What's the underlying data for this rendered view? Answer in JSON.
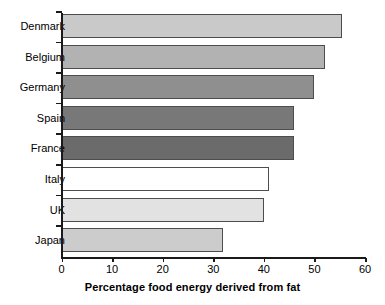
{
  "chart_data": {
    "type": "bar",
    "orientation": "horizontal",
    "title": "",
    "xlabel": "Percentage food energy derived from fat",
    "ylabel": "",
    "xlim": [
      0,
      60
    ],
    "xticks": [
      0,
      10,
      20,
      30,
      40,
      50,
      60
    ],
    "xtick_labels": [
      "0",
      "10",
      "20",
      "30",
      "40",
      "50",
      "60"
    ],
    "grid": false,
    "legend": false,
    "categories": [
      "Denmark",
      "Belgium",
      "Germany",
      "Spain",
      "France",
      "Italy",
      "UK",
      "Japan"
    ],
    "values": [
      55.5,
      52,
      50,
      46,
      46,
      41,
      40,
      32
    ],
    "bar_colors": [
      "#c9c9c9",
      "#b2b2b2",
      "#8f8f8f",
      "#787878",
      "#6b6b6b",
      "#ffffff",
      "#e2e2e2",
      "#cccccc"
    ],
    "bar_edge_color": "#4d4d4d",
    "axis_color": "#1a1a1a",
    "background": "#ffffff"
  },
  "bars": [
    {
      "label": "Denmark",
      "value": 55.5,
      "color": "#c9c9c9"
    },
    {
      "label": "Belgium",
      "value": 52,
      "color": "#b2b2b2"
    },
    {
      "label": "Germany",
      "value": 50,
      "color": "#8f8f8f"
    },
    {
      "label": "Spain",
      "value": 46,
      "color": "#787878"
    },
    {
      "label": "France",
      "value": 46,
      "color": "#6b6b6b"
    },
    {
      "label": "Italy",
      "value": 41,
      "color": "#ffffff"
    },
    {
      "label": "UK",
      "value": 40,
      "color": "#e2e2e2"
    },
    {
      "label": "Japan",
      "value": 32,
      "color": "#cccccc"
    }
  ],
  "axis": {
    "x_title": "Percentage food energy derived from fat",
    "ticks": [
      "0",
      "10",
      "20",
      "30",
      "40",
      "50",
      "60"
    ]
  }
}
